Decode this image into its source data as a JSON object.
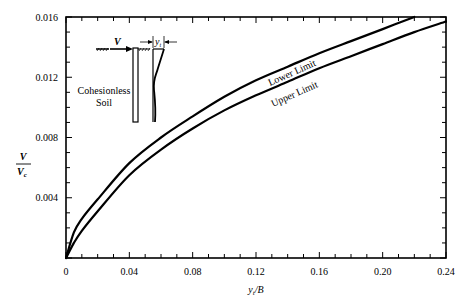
{
  "chart_data": {
    "type": "line",
    "title": "",
    "xlabel": "y_t/B",
    "ylabel": "V/V_c",
    "xlim": [
      0,
      0.24
    ],
    "ylim": [
      0,
      0.016
    ],
    "grid": false,
    "legend": "none (curves labeled inline)",
    "x_ticks": [
      "0",
      "0.04",
      "0.08",
      "0.12",
      "0.16",
      "0.20",
      "0.24"
    ],
    "y_ticks": [
      "0.004",
      "0.008",
      "0.012",
      "0.016"
    ],
    "series": [
      {
        "name": "Lower Limit",
        "x": [
          0,
          0.005,
          0.01,
          0.02,
          0.04,
          0.06,
          0.08,
          0.1,
          0.12,
          0.14,
          0.16,
          0.18,
          0.2,
          0.22
        ],
        "values": [
          0,
          0.0017,
          0.0026,
          0.0039,
          0.0063,
          0.008,
          0.0094,
          0.0107,
          0.0118,
          0.0127,
          0.0136,
          0.0144,
          0.0152,
          0.016
        ]
      },
      {
        "name": "Upper Limit",
        "x": [
          0,
          0.005,
          0.01,
          0.02,
          0.04,
          0.06,
          0.08,
          0.1,
          0.12,
          0.14,
          0.16,
          0.18,
          0.2,
          0.22,
          0.24
        ],
        "values": [
          0,
          0.001,
          0.0018,
          0.0031,
          0.0055,
          0.0072,
          0.0086,
          0.0098,
          0.0108,
          0.0117,
          0.0126,
          0.0134,
          0.0142,
          0.015,
          0.0157
        ]
      }
    ],
    "annotations": [
      "Lower Limit",
      "Upper Limit",
      "Cohesionless Soil",
      "V",
      "y_t"
    ]
  },
  "labels": {
    "xlabel_main": "y",
    "xlabel_sub": "t",
    "xlabel_rest": "/B",
    "ylabel_num": "V",
    "ylabel_den": "V",
    "ylabel_den_sub": "c",
    "lower": "Lower Limit",
    "upper": "Upper Limit",
    "soil_line1": "Cohesionless",
    "soil_line2": "Soil",
    "inset_v": "V",
    "inset_yt": "y",
    "inset_yt_sub": "t"
  }
}
